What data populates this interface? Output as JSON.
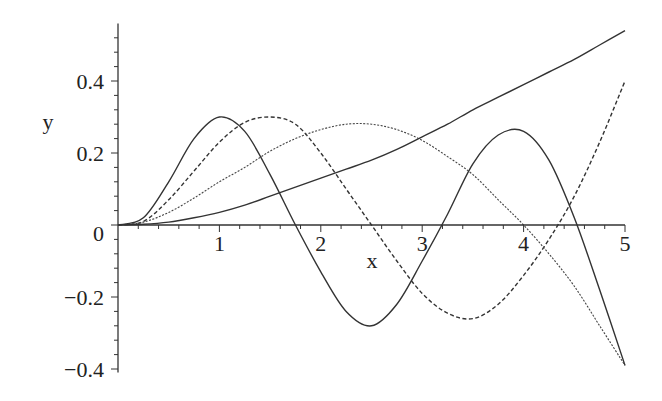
{
  "chart_data": {
    "type": "line",
    "title": "",
    "xlabel": "x",
    "ylabel": "y",
    "xlim": [
      0,
      5
    ],
    "ylim": [
      -0.41,
      0.56
    ],
    "grid": false,
    "legend": null,
    "x_ticks": [
      1,
      2,
      3,
      4,
      5
    ],
    "x_tick_labels": [
      "1",
      "2",
      "3",
      "4",
      "5"
    ],
    "y_ticks": [
      -0.4,
      -0.2,
      0,
      0.2,
      0.4
    ],
    "y_tick_labels": [
      "−0.4",
      "−0.2",
      "0",
      "0.2",
      "0.4"
    ],
    "x": [
      0,
      0.25,
      0.5,
      0.75,
      1.0,
      1.25,
      1.5,
      1.75,
      2.0,
      2.25,
      2.5,
      2.75,
      3.0,
      3.25,
      3.5,
      3.75,
      4.0,
      4.25,
      4.5,
      4.75,
      5.0
    ],
    "series": [
      {
        "name": "curve-1 (solid, fast oscillation)",
        "style": "solid",
        "color": "#333333",
        "values": [
          0,
          0.02,
          0.12,
          0.24,
          0.3,
          0.26,
          0.14,
          0.0,
          -0.13,
          -0.24,
          -0.28,
          -0.22,
          -0.1,
          0.03,
          0.17,
          0.25,
          0.26,
          0.18,
          0.02,
          -0.18,
          -0.39
        ]
      },
      {
        "name": "curve-2 (dashed)",
        "style": "dashed",
        "color": "#333333",
        "values": [
          0,
          0.01,
          0.07,
          0.15,
          0.23,
          0.285,
          0.3,
          0.28,
          0.2,
          0.1,
          0.0,
          -0.1,
          -0.19,
          -0.245,
          -0.26,
          -0.22,
          -0.14,
          -0.04,
          0.08,
          0.23,
          0.4
        ]
      },
      {
        "name": "curve-3 (fine dash)",
        "style": "dotted",
        "color": "#444444",
        "values": [
          0,
          0.008,
          0.035,
          0.075,
          0.12,
          0.16,
          0.205,
          0.24,
          0.265,
          0.28,
          0.28,
          0.265,
          0.235,
          0.19,
          0.14,
          0.07,
          0.0,
          -0.08,
          -0.17,
          -0.28,
          -0.39
        ]
      },
      {
        "name": "curve-4 (solid, monotonic)",
        "style": "solid",
        "color": "#333333",
        "values": [
          0,
          0.002,
          0.008,
          0.02,
          0.035,
          0.055,
          0.08,
          0.105,
          0.13,
          0.155,
          0.18,
          0.21,
          0.245,
          0.28,
          0.32,
          0.355,
          0.39,
          0.425,
          0.46,
          0.5,
          0.54
        ]
      }
    ]
  }
}
